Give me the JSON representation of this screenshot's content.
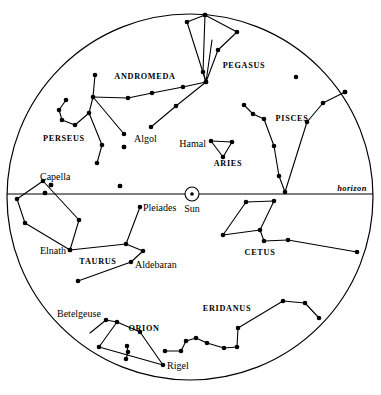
{
  "chart_data": {
    "type": "scatter",
    "title": "",
    "subtitle": "",
    "xlabel": "",
    "ylabel": "",
    "projection": "circular sky dome",
    "grid": false,
    "legend": false,
    "dome": {
      "cx": 190,
      "cy": 197,
      "r": 183
    },
    "horizon": {
      "y": 194,
      "label": "horizon",
      "label_x": 352,
      "label_y": 191
    },
    "sun": {
      "label": "Sun",
      "x": 192,
      "y": 194,
      "radius": 7,
      "dot_radius": 1.8,
      "label_x": 192,
      "label_y": 212
    },
    "constellation_labels": [
      {
        "name": "ANDROMEDA",
        "x": 145,
        "y": 79
      },
      {
        "name": "PEGASUS",
        "x": 244,
        "y": 68
      },
      {
        "name": "PERSEUS",
        "x": 64,
        "y": 141
      },
      {
        "name": "PISCES",
        "x": 292,
        "y": 121
      },
      {
        "name": "ARIES",
        "x": 228,
        "y": 166
      },
      {
        "name": "TAURUS",
        "x": 98,
        "y": 264
      },
      {
        "name": "CETUS",
        "x": 260,
        "y": 255
      },
      {
        "name": "ORION",
        "x": 144,
        "y": 331
      },
      {
        "name": "ERIDANUS",
        "x": 227,
        "y": 311
      }
    ],
    "star_labels": [
      {
        "name": "Algol",
        "x": 134,
        "y": 142,
        "anchor": "start"
      },
      {
        "name": "Hamal",
        "x": 206,
        "y": 147,
        "anchor": "end"
      },
      {
        "name": "Capella",
        "x": 40,
        "y": 180,
        "anchor": "start"
      },
      {
        "name": "Pleiades",
        "x": 143,
        "y": 211,
        "anchor": "start"
      },
      {
        "name": "Elnath",
        "x": 66,
        "y": 254,
        "anchor": "end"
      },
      {
        "name": "Aldebaran",
        "x": 135,
        "y": 268,
        "anchor": "start"
      },
      {
        "name": "Betelgeuse",
        "x": 57,
        "y": 317,
        "anchor": "start"
      },
      {
        "name": "Rigel",
        "x": 167,
        "y": 369,
        "anchor": "start"
      }
    ],
    "constellations": [
      {
        "name": "Pegasus",
        "stars": [
          [
            187,
            22
          ],
          [
            205,
            15
          ],
          [
            237,
            32
          ],
          [
            218,
            50
          ],
          [
            206,
            82
          ],
          [
            176,
            106
          ],
          [
            151,
            127
          ]
        ],
        "lines": [
          [
            [
              205,
              15
            ],
            [
              187,
              22
            ]
          ],
          [
            [
              187,
              22
            ],
            [
              206,
              82
            ]
          ],
          [
            [
              205,
              15
            ],
            [
              237,
              32
            ]
          ],
          [
            [
              237,
              32
            ],
            [
              218,
              50
            ]
          ],
          [
            [
              218,
              50
            ],
            [
              206,
              82
            ]
          ],
          [
            [
              206,
              82
            ],
            [
              176,
              106
            ]
          ],
          [
            [
              176,
              106
            ],
            [
              151,
              127
            ]
          ]
        ]
      },
      {
        "name": "Andromeda",
        "stars": [
          [
            128,
            98
          ],
          [
            152,
            93
          ],
          [
            183,
            87
          ],
          [
            206,
            82
          ],
          [
            203,
            72
          ],
          [
            205,
            15
          ]
        ],
        "lines": [
          [
            [
              128,
              98
            ],
            [
              152,
              93
            ]
          ],
          [
            [
              152,
              93
            ],
            [
              183,
              87
            ]
          ],
          [
            [
              183,
              87
            ],
            [
              206,
              82
            ]
          ],
          [
            [
              206,
              82
            ],
            [
              203,
              72
            ]
          ],
          [
            [
              203,
              72
            ],
            [
              205,
              15
            ]
          ],
          [
            [
              206,
              82
            ],
            [
              212,
              40
            ]
          ]
        ]
      },
      {
        "name": "Perseus",
        "stars": [
          [
            95,
            75
          ],
          [
            93,
            97
          ],
          [
            89,
            113
          ],
          [
            75,
            125
          ],
          [
            62,
            120
          ],
          [
            59,
            110
          ],
          [
            66,
            100
          ],
          [
            102,
            145
          ],
          [
            97,
            163
          ],
          [
            124,
            134
          ],
          [
            124,
            147
          ],
          [
            120,
            186
          ]
        ],
        "lines": [
          [
            [
              95,
              75
            ],
            [
              93,
              97
            ]
          ],
          [
            [
              93,
              97
            ],
            [
              89,
              113
            ]
          ],
          [
            [
              89,
              113
            ],
            [
              75,
              125
            ]
          ],
          [
            [
              75,
              125
            ],
            [
              62,
              120
            ]
          ],
          [
            [
              62,
              120
            ],
            [
              59,
              110
            ]
          ],
          [
            [
              59,
              110
            ],
            [
              66,
              100
            ]
          ],
          [
            [
              93,
              97
            ],
            [
              128,
              98
            ]
          ],
          [
            [
              93,
              97
            ],
            [
              124,
              134
            ]
          ],
          [
            [
              89,
              113
            ],
            [
              102,
              145
            ]
          ],
          [
            [
              102,
              145
            ],
            [
              97,
              163
            ]
          ]
        ]
      },
      {
        "name": "Pisces",
        "stars": [
          [
            244,
            105
          ],
          [
            253,
            114
          ],
          [
            264,
            119
          ],
          [
            274,
            146
          ],
          [
            279,
            176
          ],
          [
            285,
            192
          ],
          [
            307,
            122
          ],
          [
            323,
            103
          ],
          [
            345,
            92
          ]
        ],
        "lines": [
          [
            [
              244,
              105
            ],
            [
              253,
              114
            ]
          ],
          [
            [
              253,
              114
            ],
            [
              264,
              119
            ]
          ],
          [
            [
              264,
              119
            ],
            [
              274,
              146
            ]
          ],
          [
            [
              274,
              146
            ],
            [
              279,
              176
            ]
          ],
          [
            [
              279,
              176
            ],
            [
              285,
              192
            ]
          ],
          [
            [
              285,
              192
            ],
            [
              307,
              122
            ]
          ],
          [
            [
              307,
              122
            ],
            [
              323,
              103
            ]
          ],
          [
            [
              323,
              103
            ],
            [
              345,
              92
            ]
          ]
        ]
      },
      {
        "name": "Aries",
        "stars": [
          [
            211,
            141
          ],
          [
            232,
            142
          ],
          [
            223,
            157
          ]
        ],
        "lines": [
          [
            [
              211,
              141
            ],
            [
              232,
              142
            ]
          ],
          [
            [
              232,
              142
            ],
            [
              223,
              157
            ]
          ],
          [
            [
              223,
              157
            ],
            [
              211,
              141
            ]
          ]
        ]
      },
      {
        "name": "Auriga",
        "stars": [
          [
            43,
            181
          ],
          [
            51,
            185
          ],
          [
            45,
            193
          ],
          [
            79,
            220
          ],
          [
            70,
            250
          ],
          [
            25,
            223
          ],
          [
            17,
            199
          ]
        ],
        "lines": [
          [
            [
              43,
              181
            ],
            [
              79,
              220
            ]
          ],
          [
            [
              79,
              220
            ],
            [
              70,
              250
            ]
          ],
          [
            [
              70,
              250
            ],
            [
              25,
              223
            ]
          ],
          [
            [
              25,
              223
            ],
            [
              17,
              199
            ]
          ],
          [
            [
              17,
              199
            ],
            [
              43,
              181
            ]
          ]
        ]
      },
      {
        "name": "Taurus",
        "stars": [
          [
            140,
            207
          ],
          [
            126,
            244
          ],
          [
            70,
            250
          ],
          [
            143,
            251
          ],
          [
            131,
            262
          ],
          [
            78,
            281
          ]
        ],
        "lines": [
          [
            [
              140,
              207
            ],
            [
              126,
              244
            ]
          ],
          [
            [
              126,
              244
            ],
            [
              70,
              250
            ]
          ],
          [
            [
              126,
              244
            ],
            [
              143,
              251
            ]
          ],
          [
            [
              143,
              251
            ],
            [
              131,
              262
            ]
          ],
          [
            [
              131,
              262
            ],
            [
              78,
              281
            ]
          ]
        ]
      },
      {
        "name": "Cetus",
        "stars": [
          [
            274,
            201
          ],
          [
            246,
            202
          ],
          [
            223,
            235
          ],
          [
            260,
            230
          ],
          [
            264,
            241
          ],
          [
            288,
            240
          ],
          [
            357,
            252
          ]
        ],
        "lines": [
          [
            [
              274,
              201
            ],
            [
              246,
              202
            ]
          ],
          [
            [
              246,
              202
            ],
            [
              223,
              235
            ]
          ],
          [
            [
              223,
              235
            ],
            [
              260,
              230
            ]
          ],
          [
            [
              260,
              230
            ],
            [
              274,
              201
            ]
          ],
          [
            [
              260,
              230
            ],
            [
              264,
              241
            ]
          ],
          [
            [
              264,
              241
            ],
            [
              288,
              240
            ]
          ],
          [
            [
              288,
              240
            ],
            [
              357,
              252
            ]
          ]
        ]
      },
      {
        "name": "Orion",
        "stars": [
          [
            106,
            320
          ],
          [
            117,
            322
          ],
          [
            140,
            332
          ],
          [
            127,
            346
          ],
          [
            128,
            352
          ],
          [
            126,
            359
          ],
          [
            99,
            347
          ],
          [
            163,
            365
          ]
        ],
        "lines": [
          [
            [
              106,
              320
            ],
            [
              117,
              322
            ]
          ],
          [
            [
              117,
              322
            ],
            [
              140,
              332
            ]
          ],
          [
            [
              140,
              332
            ],
            [
              163,
              365
            ]
          ],
          [
            [
              117,
              322
            ],
            [
              99,
              347
            ]
          ],
          [
            [
              99,
              347
            ],
            [
              163,
              365
            ]
          ],
          [
            [
              127,
              346
            ],
            [
              128,
              352
            ]
          ],
          [
            [
              128,
              352
            ],
            [
              126,
              359
            ]
          ],
          [
            [
              90,
              333
            ],
            [
              106,
              320
            ]
          ]
        ]
      },
      {
        "name": "Eridanus",
        "stars": [
          [
            165,
            351
          ],
          [
            181,
            351
          ],
          [
            186,
            341
          ],
          [
            196,
            338
          ],
          [
            207,
            343
          ],
          [
            224,
            348
          ],
          [
            237,
            347
          ],
          [
            238,
            328
          ],
          [
            283,
            301
          ],
          [
            305,
            303
          ],
          [
            319,
            318
          ]
        ],
        "lines": [
          [
            [
              165,
              351
            ],
            [
              181,
              351
            ]
          ],
          [
            [
              181,
              351
            ],
            [
              186,
              341
            ]
          ],
          [
            [
              186,
              341
            ],
            [
              196,
              338
            ]
          ],
          [
            [
              196,
              338
            ],
            [
              207,
              343
            ]
          ],
          [
            [
              207,
              343
            ],
            [
              224,
              348
            ]
          ],
          [
            [
              224,
              348
            ],
            [
              237,
              347
            ]
          ],
          [
            [
              237,
              347
            ],
            [
              238,
              328
            ]
          ],
          [
            [
              238,
              328
            ],
            [
              283,
              301
            ]
          ],
          [
            [
              283,
              301
            ],
            [
              305,
              303
            ]
          ],
          [
            [
              305,
              303
            ],
            [
              319,
              318
            ]
          ]
        ]
      }
    ],
    "loose_stars": [
      [
        296,
        77
      ],
      [
        124,
        147
      ],
      [
        120,
        186
      ],
      [
        51,
        185
      ],
      [
        45,
        193
      ],
      [
        345,
        92
      ]
    ]
  }
}
